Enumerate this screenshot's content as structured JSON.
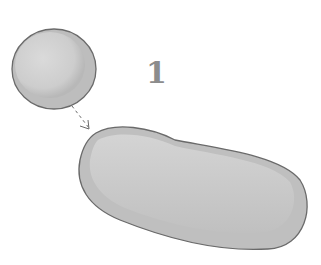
{
  "diagram": {
    "step_number": "1",
    "nodes": [
      {
        "id": "round-cell",
        "shape": "disc",
        "fill": "#c8c8c8",
        "highlight": "#d9d9d9",
        "stroke": "#6e6e6e"
      },
      {
        "id": "elongated-cell",
        "shape": "bean",
        "fill": "#c4c4c4",
        "highlight": "#d6d6d6",
        "stroke": "#6e6e6e"
      }
    ],
    "edges": [
      {
        "from": "round-cell",
        "to": "elongated-cell",
        "style": "dashed-arrow"
      }
    ]
  }
}
